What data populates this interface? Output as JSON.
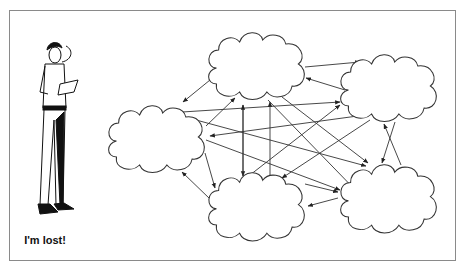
{
  "figure": {
    "caption": "I'm lost!",
    "person": "confused-man-icon",
    "nodes": [
      {
        "id": "top",
        "shape": "cloud"
      },
      {
        "id": "right-top",
        "shape": "cloud"
      },
      {
        "id": "left",
        "shape": "cloud"
      },
      {
        "id": "bottom",
        "shape": "cloud"
      },
      {
        "id": "bottom-right",
        "shape": "cloud"
      }
    ],
    "edges_description": "Tangled web of directed arrows interconnecting all five clouds"
  },
  "colors": {
    "line": "#333333",
    "frame": "#8a8a8a",
    "background": "#ffffff"
  }
}
